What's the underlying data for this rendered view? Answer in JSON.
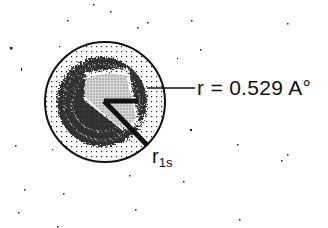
{
  "diagram": {
    "radius_label": "r = 0.529 A°",
    "r1s_label": {
      "main": "r",
      "subscript": "1s"
    },
    "colors": {
      "ink": "#111111",
      "background": "#ffffff"
    },
    "circle": {
      "cx": 105,
      "cy": 102,
      "r": 60
    },
    "leader_line": {
      "x1": 147,
      "y1": 88,
      "x2": 195,
      "y2": 88
    },
    "radius_arrow": {
      "x1": 104,
      "y1": 101,
      "x2": 147,
      "y2": 145
    }
  }
}
